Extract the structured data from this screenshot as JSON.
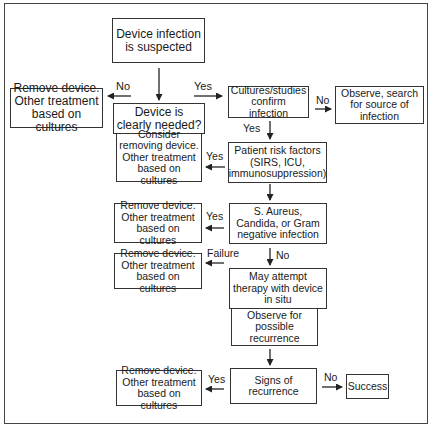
{
  "diagram": {
    "type": "flowchart",
    "nodes": {
      "start": "Device infection is suspected",
      "remove_1": "Remove device. Other treatment based on cultures",
      "clearly_needed": "Device is clearly needed?",
      "consider_removing": "Consider removing device. Other treatment based on cultures",
      "cultures_confirm": "Cultures/studies confirm infection",
      "observe_search": "Observe, search for source of infection",
      "risk_factors": "Patient risk factors (SIRS, ICU, immunosuppression)",
      "remove_2": "Remove device. Other treatment based on cultures",
      "organisms": "S. Aureus, Candida, or Gram negative infection",
      "remove_3": "Remove device. Other treatment based on cultures",
      "attempt_therapy": "May attempt therapy with device in situ",
      "observe_recurrence": "Observe for possible recurrence",
      "remove_4": "Remove device. Other treatment based on cultures",
      "signs_recurrence": "Signs of recurrence",
      "success": "Success"
    },
    "edge_labels": {
      "start_no": "No",
      "start_yes": "Yes",
      "cultures_no": "No",
      "cultures_yes": "Yes",
      "risk_yes": "Yes",
      "organisms_yes": "Yes",
      "organisms_no": "No",
      "therapy_failure": "Failure",
      "recurrence_yes": "Yes",
      "recurrence_no": "No"
    },
    "edges": [
      {
        "from": "start",
        "to": "clearly_needed"
      },
      {
        "from": "start",
        "to": "remove_1",
        "label": "No"
      },
      {
        "from": "start",
        "to": "cultures_confirm",
        "label": "Yes"
      },
      {
        "from": "cultures_confirm",
        "to": "observe_search",
        "label": "No"
      },
      {
        "from": "cultures_confirm",
        "to": "risk_factors",
        "label": "Yes"
      },
      {
        "from": "risk_factors",
        "to": "consider_removing",
        "label": "Yes"
      },
      {
        "from": "risk_factors",
        "to": "organisms"
      },
      {
        "from": "organisms",
        "to": "remove_2",
        "label": "Yes"
      },
      {
        "from": "organisms",
        "to": "attempt_therapy",
        "label": "No"
      },
      {
        "from": "attempt_therapy",
        "to": "remove_3",
        "label": "Failure"
      },
      {
        "from": "observe_recurrence",
        "to": "signs_recurrence"
      },
      {
        "from": "signs_recurrence",
        "to": "remove_4",
        "label": "Yes"
      },
      {
        "from": "signs_recurrence",
        "to": "success",
        "label": "No"
      }
    ]
  }
}
